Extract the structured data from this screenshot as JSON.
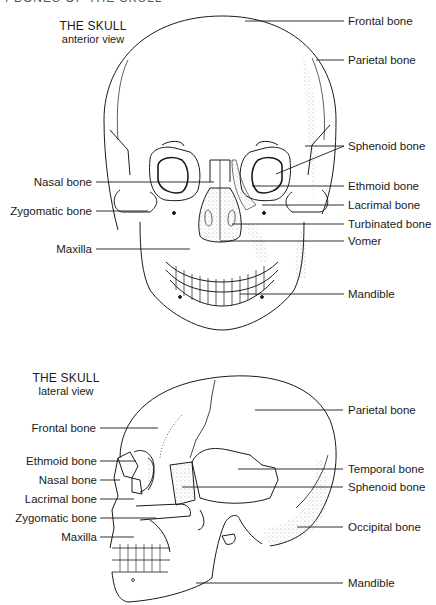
{
  "top_cut_text": "4  BONES OF THE SKULL",
  "anterior": {
    "title": "THE SKULL",
    "subtitle": "anterior view",
    "labels_right": [
      {
        "text": "Frontal bone",
        "x": 370,
        "y": 14
      },
      {
        "text": "Parietal bone",
        "x": 370,
        "y": 53
      },
      {
        "text": "Sphenoid bone",
        "x": 370,
        "y": 144
      },
      {
        "text": "Ethmoid bone",
        "x": 370,
        "y": 184
      },
      {
        "text": "Lacrimal bone",
        "x": 370,
        "y": 203
      },
      {
        "text": "Turbinated bone",
        "x": 370,
        "y": 223
      },
      {
        "text": "Vomer",
        "x": 370,
        "y": 240
      },
      {
        "text": "Mandible",
        "x": 370,
        "y": 291
      }
    ],
    "labels_left": [
      {
        "text": "Nasal bone",
        "right": 92,
        "y": 180
      },
      {
        "text": "Zygomatic bone",
        "right": 92,
        "y": 209
      },
      {
        "text": "Maxilla",
        "right": 92,
        "y": 248
      }
    ]
  },
  "lateral": {
    "title": "THE SKULL",
    "subtitle": "lateral view",
    "labels_right": [
      {
        "text": "Parietal bone",
        "x": 350,
        "y": 404
      },
      {
        "text": "Temporal bone",
        "x": 350,
        "y": 463
      },
      {
        "text": "Sphenoid bone",
        "x": 350,
        "y": 481
      },
      {
        "text": "Occipital bone",
        "x": 350,
        "y": 521
      },
      {
        "text": "Mandible",
        "x": 350,
        "y": 577
      }
    ],
    "labels_left": [
      {
        "text": "Frontal bone",
        "right": 96,
        "y": 422
      },
      {
        "text": "Ethmoid bone",
        "right": 97,
        "y": 455
      },
      {
        "text": "Nasal bone",
        "right": 97,
        "y": 474
      },
      {
        "text": "Lacrimal bone",
        "right": 97,
        "y": 493
      },
      {
        "text": "Zygomatic bone",
        "right": 97,
        "y": 513
      },
      {
        "text": "Maxilla",
        "right": 97,
        "y": 532
      }
    ]
  },
  "colors": {
    "line": "#1a1a1a",
    "stipple": "#555555",
    "background": "#ffffff"
  }
}
